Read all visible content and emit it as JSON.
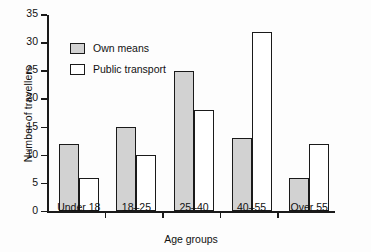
{
  "chart_data": {
    "type": "bar",
    "title": "",
    "xlabel": "Age groups",
    "ylabel": "Number of travellers",
    "categories": [
      "Under 18",
      "18–25",
      "25–40",
      "40–55",
      "Over 55"
    ],
    "series": [
      {
        "name": "Own means",
        "values": [
          12,
          15,
          25,
          13,
          6
        ],
        "color": "#d2d2d2"
      },
      {
        "name": "Public transport",
        "values": [
          6,
          10,
          18,
          32,
          12
        ],
        "color": "#ffffff"
      }
    ],
    "ylim": [
      0,
      35
    ],
    "yticks": [
      0,
      5,
      10,
      15,
      20,
      25,
      30,
      35
    ],
    "grid": false,
    "legend_position": "upper-left-inside"
  },
  "legend": {
    "items": [
      {
        "label": "Own means"
      },
      {
        "label": "Public transport"
      }
    ]
  },
  "axes": {
    "y_title": "Number of travellers",
    "x_title": "Age groups"
  }
}
